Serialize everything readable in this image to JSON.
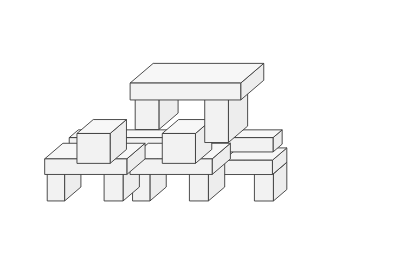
{
  "figure": {
    "canvas": {
      "width": 399,
      "height": 263,
      "background": "#ffffff"
    },
    "style": {
      "stroke_color": "#3a3a3a",
      "stroke_width": 0.9,
      "fill_top": "#f7f7f7",
      "fill_front": "#f2f2f2",
      "fill_side": "#ededed"
    },
    "projection": {
      "type": "isometric-oblique",
      "origin_x": 30,
      "origin_y": 196,
      "unit_x": [
        15.8,
        0
      ],
      "unit_y": [
        9.6,
        -8.2
      ],
      "unit_z": [
        0,
        -13.0
      ]
    },
    "block_count": 14,
    "blocks": [
      {
        "name": "top-beam",
        "pos": [
          5.0,
          2.2,
          6.0
        ],
        "size": [
          7.0,
          2.4,
          1.3
        ]
      },
      {
        "name": "top-left-pillar",
        "pos": [
          5.2,
          2.4,
          3.6
        ],
        "size": [
          1.5,
          2.0,
          2.4
        ]
      },
      {
        "name": "top-right-pillar",
        "pos": [
          9.6,
          2.4,
          2.6
        ],
        "size": [
          1.5,
          2.0,
          3.4
        ]
      },
      {
        "name": "left-diagonal-beam",
        "pos": [
          2.3,
          0.3,
          3.2
        ],
        "size": [
          6.6,
          0.95,
          1.1
        ]
      },
      {
        "name": "right-diagonal-beam",
        "pos": [
          8.6,
          0.3,
          3.2
        ],
        "size": [
          6.6,
          0.95,
          1.1
        ]
      },
      {
        "name": "left-upper-cube",
        "pos": [
          2.0,
          1.6,
          1.5
        ],
        "size": [
          2.1,
          1.7,
          2.3
        ]
      },
      {
        "name": "center-upper-cube",
        "pos": [
          7.4,
          1.6,
          1.5
        ],
        "size": [
          2.1,
          1.7,
          2.3
        ]
      },
      {
        "name": "left-mid-slab",
        "pos": [
          3.6,
          0.6,
          1.5
        ],
        "size": [
          4.1,
          1.1,
          1.1
        ]
      },
      {
        "name": "right-mid-slab",
        "pos": [
          9.1,
          0.6,
          1.5
        ],
        "size": [
          4.1,
          1.1,
          1.1
        ]
      },
      {
        "name": "left-base-slab",
        "pos": [
          0.2,
          1.2,
          0.9
        ],
        "size": [
          5.2,
          1.9,
          1.2
        ]
      },
      {
        "name": "left-base-leg-outer",
        "pos": [
          0.3,
          1.3,
          -1.2
        ],
        "size": [
          1.1,
          1.7,
          2.1
        ]
      },
      {
        "name": "left-base-leg-inner",
        "pos": [
          3.9,
          1.3,
          -1.2
        ],
        "size": [
          1.2,
          1.7,
          2.1
        ]
      },
      {
        "name": "right-base-slab",
        "pos": [
          5.6,
          1.2,
          0.9
        ],
        "size": [
          5.2,
          1.9,
          1.2
        ]
      },
      {
        "name": "right-base-leg-outer",
        "pos": [
          5.7,
          1.3,
          -1.2
        ],
        "size": [
          1.1,
          1.7,
          2.1
        ]
      },
      {
        "name": "right-base-leg-inner",
        "pos": [
          9.3,
          1.3,
          -1.2
        ],
        "size": [
          1.2,
          1.7,
          2.1
        ]
      },
      {
        "name": "far-right-slab",
        "pos": [
          12.0,
          0.4,
          1.4
        ],
        "size": [
          3.1,
          1.5,
          1.1
        ]
      },
      {
        "name": "far-right-leg",
        "pos": [
          13.9,
          0.5,
          -0.7
        ],
        "size": [
          1.2,
          1.4,
          2.1
        ]
      }
    ]
  }
}
